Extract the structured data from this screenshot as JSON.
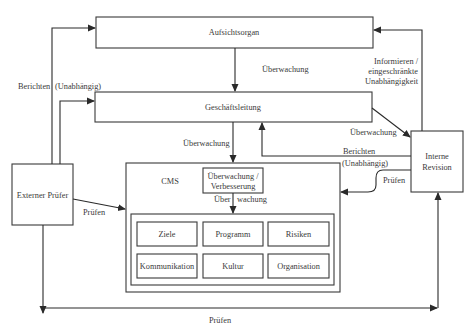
{
  "diagram": {
    "type": "organizational flow diagram",
    "nodes": {
      "aufsichtsorgan": "Aufsichtsorgan",
      "geschaeftsleitung": "Geschäftsleitung",
      "externer_pruefer": "Externer Prüfer",
      "interne_revision_line1": "Interne",
      "interne_revision_line2": "Revision",
      "cms": "CMS",
      "verbesserung_line1": "Überwachung /",
      "verbesserung_line2": "Verbesserung",
      "elements": [
        "Ziele",
        "Programm",
        "Risiken",
        "Kommunikation",
        "Kultur",
        "Organisation"
      ]
    },
    "edge_labels": {
      "berichten_left": "Berichten",
      "unabhaengig_left": "(Unabhängig)",
      "ueberwachung_top": "Überwachung",
      "informieren_line1": "Informieren /",
      "informieren_line2": "eingeschränkte",
      "informieren_line3": "Unabhängigkeit",
      "ueberwachung_gl_cms": "Überwachung",
      "ueberwachung_gl_ir": "Überwachung",
      "berichten_right": "Berichten",
      "unabhaengig_right": "(Unabhängig)",
      "pruefen_ir": "Prüfen",
      "pruefen_ext": "Prüfen",
      "ueber_split_a": "Über",
      "ueber_split_b": "wachung",
      "pruefen_bottom": "Prüfen"
    },
    "colors": {
      "stroke": "#2a2a2a",
      "text": "#3a3a3a",
      "background": "#ffffff"
    }
  }
}
